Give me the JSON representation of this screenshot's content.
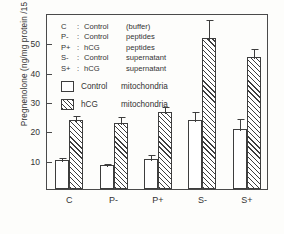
{
  "chart_data": {
    "type": "bar",
    "title": "",
    "xlabel": "",
    "ylabel": "Pregnenolone (ng/mg protein /15 min)",
    "ylim": [
      0,
      60
    ],
    "yticks": [
      10,
      20,
      30,
      40,
      50
    ],
    "ytick_labels": [
      "10",
      "20",
      "30",
      "40",
      "50"
    ],
    "grid": false,
    "legend_position": "upper-left",
    "categories": [
      "C",
      "P-",
      "P+",
      "S-",
      "S+"
    ],
    "series": [
      {
        "name": "Control mitochondria",
        "fill": "open",
        "values": [
          10.0,
          8.2,
          10.3,
          23.5,
          20.5
        ],
        "errors": [
          1.2,
          0.9,
          2.0,
          3.6,
          4.0
        ]
      },
      {
        "name": "hCG mitochondria",
        "fill": "hatched",
        "values": [
          23.5,
          22.5,
          26.2,
          51.5,
          45.0
        ],
        "errors": [
          2.2,
          2.6,
          2.4,
          6.8,
          3.4
        ]
      }
    ]
  },
  "legend_key": {
    "rows": [
      {
        "symbol": "C",
        "colon": ":",
        "part1": "Control",
        "part2": "(buffer)"
      },
      {
        "symbol": "P-",
        "colon": ":",
        "part1": "Control",
        "part2": "peptides"
      },
      {
        "symbol": "P+",
        "colon": ":",
        "part1": "hCG",
        "part2": "peptides"
      },
      {
        "symbol": "S-",
        "colon": ":",
        "part1": "Control",
        "part2": "supernatant"
      },
      {
        "symbol": "S+",
        "colon": ":",
        "part1": "hCG",
        "part2": "supernatant"
      }
    ]
  },
  "swatch_legend": {
    "items": [
      {
        "fill": "open",
        "part1": "Control",
        "part2": "mitochondria"
      },
      {
        "fill": "hatched",
        "part1": "hCG",
        "part2": "mitochondria"
      }
    ]
  },
  "colors": {
    "ink": "#3d3d3d",
    "frame": "#4a4a4a",
    "background": "#fdfdfb"
  }
}
